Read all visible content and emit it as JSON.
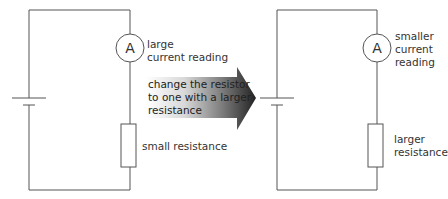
{
  "diagram": {
    "colors": {
      "wire": "#555555",
      "arrow_dark": "#222222",
      "arrow_light": "#ffffff",
      "text": "#333333"
    },
    "left_circuit": {
      "ammeter_symbol": "A",
      "ammeter_label_line1": "large",
      "ammeter_label_line2": "current reading",
      "resistor_label": "small resistance"
    },
    "arrow": {
      "line1": "change the resistor",
      "line2": "to one with a larger",
      "line3": "resistance"
    },
    "right_circuit": {
      "ammeter_symbol": "A",
      "ammeter_label_line1": "smaller",
      "ammeter_label_line2": "current",
      "ammeter_label_line3": "reading",
      "resistor_label_line1": "larger",
      "resistor_label_line2": "resistance"
    }
  }
}
